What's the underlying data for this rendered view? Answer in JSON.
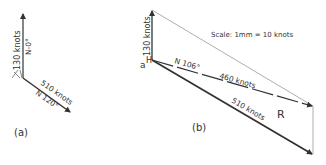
{
  "diagram_a": {
    "caption": "(a)",
    "north_vector": {
      "magnitude": "130 knots",
      "bearing": "N-0°"
    },
    "course_vector": {
      "magnitude": "510 knots",
      "bearing": "N 120°"
    }
  },
  "diagram_b": {
    "caption": "(b)",
    "scale": "Scale: 1mm = 10 knots",
    "origin_labels": {
      "a": "a",
      "h": "H"
    },
    "wind_vector": {
      "magnitude": "130 knots"
    },
    "resultant_vector": {
      "bearing": "N 106°",
      "magnitude": "460 knots",
      "label": "R"
    },
    "course_vector": {
      "magnitude": "510 knots"
    }
  },
  "colors": {
    "ink": "#333333",
    "thin_line": "#888888",
    "background": "#ffffff"
  }
}
